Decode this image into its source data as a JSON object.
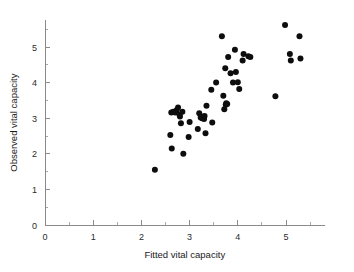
{
  "chart_data": {
    "type": "scatter",
    "title": "",
    "xlabel": "Fitted vital capacity",
    "ylabel": "Observed vital capacity",
    "xlim": [
      0,
      5.8
    ],
    "ylim": [
      0,
      5.75
    ],
    "xticks": [
      0,
      1,
      2,
      3,
      4,
      5
    ],
    "yticks": [
      0,
      1,
      2,
      3,
      4,
      5
    ],
    "xtick_labels": [
      "0",
      "1",
      "2",
      "3",
      "4",
      "5"
    ],
    "ytick_labels": [
      "0",
      "1",
      "2",
      "3",
      "4",
      "5"
    ],
    "xminorticks": [
      0.5,
      1.5,
      2.5,
      3.5,
      4.5,
      5.5
    ],
    "yminorticks": [
      0.5,
      1.5,
      2.5,
      3.5,
      4.5,
      5.5
    ],
    "grid": false,
    "legend": null,
    "marker": "filled-circle",
    "marker_color": "#0d0d0d",
    "marker_size": 3.0,
    "points": [
      {
        "x": 2.28,
        "y": 1.55
      },
      {
        "x": 2.6,
        "y": 2.53
      },
      {
        "x": 2.63,
        "y": 2.15
      },
      {
        "x": 2.62,
        "y": 3.16
      },
      {
        "x": 2.66,
        "y": 3.18
      },
      {
        "x": 2.7,
        "y": 3.16
      },
      {
        "x": 2.73,
        "y": 3.22
      },
      {
        "x": 2.76,
        "y": 3.3
      },
      {
        "x": 2.79,
        "y": 3.1
      },
      {
        "x": 2.8,
        "y": 3.05
      },
      {
        "x": 2.82,
        "y": 2.86
      },
      {
        "x": 2.85,
        "y": 3.18
      },
      {
        "x": 2.87,
        "y": 2.0
      },
      {
        "x": 2.98,
        "y": 2.47
      },
      {
        "x": 3.0,
        "y": 2.89
      },
      {
        "x": 3.17,
        "y": 2.7
      },
      {
        "x": 3.2,
        "y": 3.14
      },
      {
        "x": 3.23,
        "y": 3.02
      },
      {
        "x": 3.26,
        "y": 3.0
      },
      {
        "x": 3.28,
        "y": 3.04
      },
      {
        "x": 3.3,
        "y": 2.98
      },
      {
        "x": 3.31,
        "y": 3.06
      },
      {
        "x": 3.33,
        "y": 2.58
      },
      {
        "x": 3.35,
        "y": 3.35
      },
      {
        "x": 3.45,
        "y": 3.8
      },
      {
        "x": 3.47,
        "y": 2.88
      },
      {
        "x": 3.55,
        "y": 4.0
      },
      {
        "x": 3.67,
        "y": 5.3
      },
      {
        "x": 3.7,
        "y": 3.63
      },
      {
        "x": 3.72,
        "y": 3.25
      },
      {
        "x": 3.74,
        "y": 4.4
      },
      {
        "x": 3.75,
        "y": 3.38
      },
      {
        "x": 3.76,
        "y": 3.42
      },
      {
        "x": 3.78,
        "y": 3.4
      },
      {
        "x": 3.8,
        "y": 4.72
      },
      {
        "x": 3.85,
        "y": 4.26
      },
      {
        "x": 3.9,
        "y": 4.0
      },
      {
        "x": 3.94,
        "y": 4.92
      },
      {
        "x": 3.96,
        "y": 4.3
      },
      {
        "x": 4.0,
        "y": 4.01
      },
      {
        "x": 4.03,
        "y": 3.82
      },
      {
        "x": 4.1,
        "y": 4.62
      },
      {
        "x": 4.12,
        "y": 4.8
      },
      {
        "x": 4.22,
        "y": 4.74
      },
      {
        "x": 4.26,
        "y": 4.72
      },
      {
        "x": 4.78,
        "y": 3.62
      },
      {
        "x": 4.98,
        "y": 5.62
      },
      {
        "x": 5.08,
        "y": 4.8
      },
      {
        "x": 5.1,
        "y": 4.62
      },
      {
        "x": 5.28,
        "y": 5.3
      },
      {
        "x": 5.3,
        "y": 4.68
      }
    ]
  }
}
